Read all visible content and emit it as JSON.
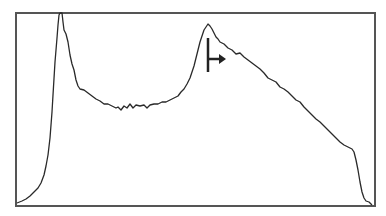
{
  "chart_data": {
    "type": "line",
    "title": "",
    "xlabel": "",
    "ylabel": "",
    "grid": false,
    "legend": null,
    "frame": {
      "x": 16,
      "y": 13,
      "width": 359,
      "height": 193
    },
    "points": [
      [
        17,
        203
      ],
      [
        22,
        201
      ],
      [
        26,
        199
      ],
      [
        30,
        196
      ],
      [
        34,
        192
      ],
      [
        38,
        188
      ],
      [
        41,
        183
      ],
      [
        44,
        175
      ],
      [
        46,
        166
      ],
      [
        48,
        155
      ],
      [
        50,
        138
      ],
      [
        52,
        112
      ],
      [
        53,
        95
      ],
      [
        55,
        62
      ],
      [
        57,
        38
      ],
      [
        58,
        25
      ],
      [
        59,
        15
      ],
      [
        60,
        13
      ],
      [
        62,
        13
      ],
      [
        63,
        22
      ],
      [
        64,
        30
      ],
      [
        66,
        34
      ],
      [
        68,
        42
      ],
      [
        70,
        55
      ],
      [
        72,
        64
      ],
      [
        74,
        70
      ],
      [
        76,
        80
      ],
      [
        78,
        86
      ],
      [
        80,
        89
      ],
      [
        84,
        90
      ],
      [
        88,
        93
      ],
      [
        92,
        96
      ],
      [
        96,
        99
      ],
      [
        100,
        101
      ],
      [
        104,
        104
      ],
      [
        108,
        104
      ],
      [
        112,
        106
      ],
      [
        116,
        108
      ],
      [
        118,
        107
      ],
      [
        121,
        110
      ],
      [
        124,
        106
      ],
      [
        127,
        108
      ],
      [
        130,
        104
      ],
      [
        133,
        108
      ],
      [
        136,
        105
      ],
      [
        140,
        106
      ],
      [
        144,
        105
      ],
      [
        147,
        108
      ],
      [
        150,
        105
      ],
      [
        154,
        104
      ],
      [
        158,
        104
      ],
      [
        162,
        102
      ],
      [
        166,
        102
      ],
      [
        170,
        100
      ],
      [
        174,
        98
      ],
      [
        178,
        96
      ],
      [
        181,
        92
      ],
      [
        184,
        89
      ],
      [
        187,
        84
      ],
      [
        190,
        78
      ],
      [
        192,
        72
      ],
      [
        194,
        66
      ],
      [
        196,
        58
      ],
      [
        198,
        50
      ],
      [
        200,
        42
      ],
      [
        202,
        36
      ],
      [
        204,
        30
      ],
      [
        206,
        27
      ],
      [
        208,
        24
      ],
      [
        210,
        26
      ],
      [
        212,
        29
      ],
      [
        214,
        33
      ],
      [
        216,
        37
      ],
      [
        218,
        39
      ],
      [
        220,
        42
      ],
      [
        224,
        44
      ],
      [
        228,
        48
      ],
      [
        232,
        50
      ],
      [
        236,
        54
      ],
      [
        240,
        53
      ],
      [
        244,
        57
      ],
      [
        248,
        60
      ],
      [
        252,
        63
      ],
      [
        256,
        66
      ],
      [
        260,
        69
      ],
      [
        264,
        73
      ],
      [
        268,
        78
      ],
      [
        272,
        80
      ],
      [
        276,
        82
      ],
      [
        280,
        87
      ],
      [
        284,
        89
      ],
      [
        288,
        92
      ],
      [
        292,
        96
      ],
      [
        296,
        100
      ],
      [
        300,
        102
      ],
      [
        304,
        107
      ],
      [
        308,
        111
      ],
      [
        312,
        115
      ],
      [
        316,
        119
      ],
      [
        320,
        122
      ],
      [
        324,
        126
      ],
      [
        328,
        130
      ],
      [
        332,
        134
      ],
      [
        336,
        138
      ],
      [
        340,
        142
      ],
      [
        344,
        145
      ],
      [
        348,
        147
      ],
      [
        352,
        149
      ],
      [
        354,
        152
      ],
      [
        356,
        160
      ],
      [
        358,
        170
      ],
      [
        360,
        182
      ],
      [
        362,
        192
      ],
      [
        364,
        198
      ],
      [
        366,
        201
      ],
      [
        369,
        202
      ],
      [
        372,
        205
      ]
    ],
    "marker": {
      "type": "gate-right-arrow",
      "line_x": 208,
      "line_y1": 38,
      "line_y2": 72,
      "arrow_y": 59,
      "arrow_x2": 226
    },
    "colors": {
      "line": "#2a2a2a",
      "frame": "#555555",
      "marker": "#222222",
      "background": "#ffffff"
    }
  }
}
